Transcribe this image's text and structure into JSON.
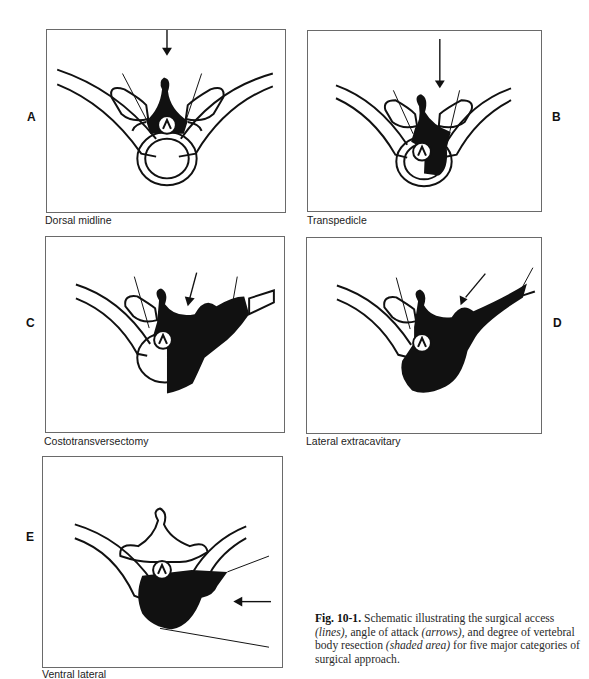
{
  "figure": {
    "panels": [
      {
        "letter": "A",
        "label": "Dorsal midline"
      },
      {
        "letter": "B",
        "label": "Transpedicle"
      },
      {
        "letter": "C",
        "label": "Costotransversectomy"
      },
      {
        "letter": "D",
        "label": "Lateral extracavitary"
      },
      {
        "letter": "E",
        "label": "Ventral lateral"
      }
    ],
    "caption": {
      "fig_label": "Fig. 10-1.",
      "part1": " Schematic illustrating the surgical access ",
      "lines": "(lines),",
      "part2": " angle of attack ",
      "arrows": "(arrows),",
      "part3": " and degree of vertebral body resection ",
      "shaded": "(shaded area)",
      "part4": " for five major categories of surgical approach."
    },
    "colors": {
      "ink": "#111111",
      "frame": "#6a6a6a",
      "background": "#ffffff"
    }
  }
}
